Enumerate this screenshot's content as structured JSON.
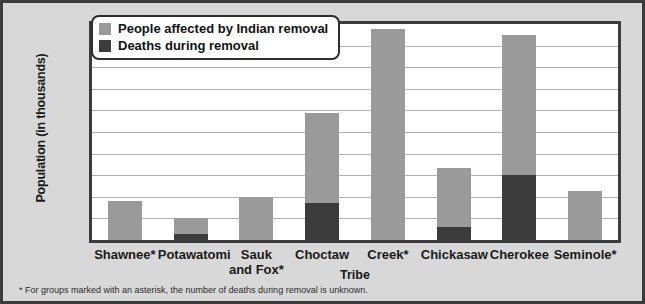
{
  "chart_data": {
    "type": "bar",
    "title": "",
    "xlabel": "Tribe",
    "ylabel": "Population (in thousands)",
    "ylim": [
      0,
      20
    ],
    "ytick_step": 2,
    "yticks": [
      20,
      18,
      16,
      14,
      12,
      10,
      8,
      6,
      4,
      2,
      0
    ],
    "grid": true,
    "legend_position": "top-left",
    "categories": [
      "Shawnee*",
      "Potawatomi",
      "Sauk and Fox*",
      "Choctaw",
      "Creek*",
      "Chickasaw",
      "Cherokee",
      "Seminole*"
    ],
    "category_lines": [
      [
        "Shawnee*"
      ],
      [
        "Potawatomi"
      ],
      [
        "Sauk",
        "and Fox*"
      ],
      [
        "Choctaw"
      ],
      [
        "Creek*"
      ],
      [
        "Chickasaw"
      ],
      [
        "Cherokee"
      ],
      [
        "Seminole*"
      ]
    ],
    "series": [
      {
        "name": "People affected by Indian removal",
        "color": "#9a9a9a",
        "values": [
          3.6,
          2.0,
          4.0,
          11.8,
          19.5,
          6.7,
          19.0,
          4.5
        ]
      },
      {
        "name": "Deaths during removal",
        "color": "#3c3c3c",
        "values": [
          null,
          0.6,
          null,
          3.4,
          null,
          1.2,
          6.0,
          null
        ]
      }
    ],
    "annotations": [
      "* For groups marked with an asterisk, the number of deaths during removal is unknown."
    ]
  },
  "legend": {
    "items": [
      {
        "label": "People affected by Indian removal",
        "color": "#9a9a9a"
      },
      {
        "label": "Deaths during removal",
        "color": "#3c3c3c"
      }
    ]
  },
  "footnote": "* For groups marked with an asterisk, the number of deaths during removal is unknown.",
  "colors": {
    "light_gray_bar": "#9a9a9a",
    "dark_gray_bar": "#3c3c3c",
    "figure_background": "#d8d8d8",
    "plot_background": "#ffffff",
    "gridline": "#b0b0b0",
    "border": "#3c3c3c"
  }
}
